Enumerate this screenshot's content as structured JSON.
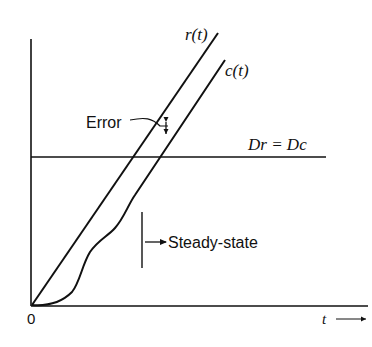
{
  "diagram": {
    "curves": {
      "reference_label": "r(t)",
      "output_label": "c(t)"
    },
    "labels": {
      "error": "Error",
      "derivative_equal": "Dr = Dc",
      "steady_state": "Steady-state",
      "origin": "0",
      "time_axis": "t"
    },
    "colors": {
      "ink": "#111111",
      "background": "#ffffff"
    }
  }
}
